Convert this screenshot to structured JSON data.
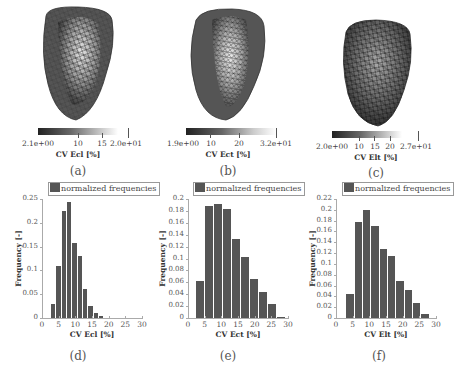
{
  "figure": {
    "panels_3d": [
      {
        "caption": "(a)",
        "colorbar": {
          "title": "CV Ecl [%]",
          "min_label": "2.1e+00",
          "max_label": "2.0e+01",
          "ticks": [
            {
              "label": "10",
              "pos": 0.43
            },
            {
              "label": "15",
              "pos": 0.71
            }
          ],
          "min": 2.1,
          "max": 20
        }
      },
      {
        "caption": "(b)",
        "colorbar": {
          "title": "CV Ect [%]",
          "min_label": "1.9e+00",
          "max_label": "3.2e+01",
          "ticks": [
            {
              "label": "10",
              "pos": 0.27
            },
            {
              "label": "20",
              "pos": 0.6
            }
          ],
          "min": 1.9,
          "max": 32
        }
      },
      {
        "caption": "(c)",
        "colorbar": {
          "title": "CV Elt [%]",
          "min_label": "2.0e+00",
          "max_label": "2.7e+01",
          "ticks": [
            {
              "label": "10",
              "pos": 0.32
            },
            {
              "label": "15",
              "pos": 0.52
            },
            {
              "label": "20",
              "pos": 0.72
            }
          ],
          "min": 2.0,
          "max": 27
        }
      }
    ],
    "histograms": [
      {
        "caption": "(d)",
        "legend": "normalized frequencies"
      },
      {
        "caption": "(e)",
        "legend": "normalized frequencies"
      },
      {
        "caption": "(f)",
        "legend": "normalized frequencies"
      }
    ]
  },
  "chart_data": [
    {
      "type": "bar",
      "title": "",
      "legend": [
        "normalized frequencies"
      ],
      "xlabel": "CV Ecl [%]",
      "ylabel": "Frequency [-]",
      "xlim": [
        0,
        30
      ],
      "ylim": [
        0,
        0.25
      ],
      "xticks": [
        "0",
        "5",
        "10",
        "15",
        "20",
        "25",
        "30"
      ],
      "yticks": [
        "0",
        "0.05",
        "0.1",
        "0.15",
        "0.2",
        "0.25"
      ],
      "bin_start": 2.1,
      "bin_width": 1.6,
      "values": [
        0.03,
        0.11,
        0.225,
        0.243,
        0.158,
        0.13,
        0.06,
        0.025,
        0.01,
        0.005
      ],
      "grid": false
    },
    {
      "type": "bar",
      "title": "",
      "legend": [
        "normalized frequencies"
      ],
      "xlabel": "CV Ect [%]",
      "ylabel": "Frequency [-]",
      "xlim": [
        0,
        30
      ],
      "ylim": [
        0,
        0.2
      ],
      "xticks": [
        "0",
        "5",
        "10",
        "15",
        "20",
        "25",
        "30"
      ],
      "yticks": [
        "0",
        "0.02",
        "0.04",
        "0.06",
        "0.08",
        "0.1",
        "0.12",
        "0.14",
        "0.16",
        "0.18",
        "0.2"
      ],
      "bin_start": 1.9,
      "bin_width": 2.7,
      "values": [
        0.062,
        0.188,
        0.191,
        0.183,
        0.132,
        0.102,
        0.065,
        0.044,
        0.023,
        0.002
      ],
      "grid": false
    },
    {
      "type": "bar",
      "title": "",
      "legend": [
        "normalized frequencies"
      ],
      "xlabel": "CV Elt [%]",
      "ylabel": "Frequency [-]",
      "xlim": [
        0,
        30
      ],
      "ylim": [
        0,
        0.22
      ],
      "xticks": [
        "0",
        "5",
        "10",
        "15",
        "20",
        "25",
        "30"
      ],
      "yticks": [
        "0",
        "0.02",
        "0.04",
        "0.06",
        "0.08",
        "0.1",
        "0.12",
        "0.14",
        "0.16",
        "0.18",
        "0.2",
        "0.22"
      ],
      "bin_start": 2.5,
      "bin_width": 2.5,
      "values": [
        0.045,
        0.178,
        0.2,
        0.17,
        0.127,
        0.115,
        0.069,
        0.051,
        0.027,
        0.007
      ],
      "grid": false
    }
  ]
}
